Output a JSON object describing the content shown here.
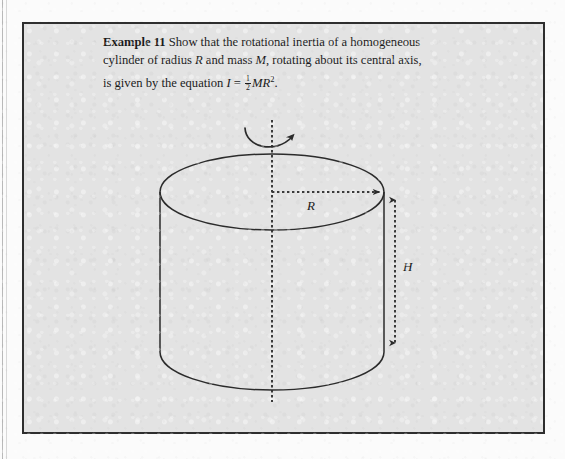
{
  "page": {
    "background_color": "#fbfbfb",
    "panel_background_color": "#e3e3e3",
    "panel_border_color": "#2e2e2e",
    "ink_color": "#1b1b1b"
  },
  "caption": {
    "example_label": "Example 11",
    "line1_text": "Show that the rotational inertia of a homogeneous",
    "line2_a": "cylinder of radius ",
    "line2_var_radius": "R",
    "line2_b": " and mass ",
    "line2_var_mass": "M",
    "line2_c": ", rotating about its central axis,",
    "line3_a": "is given by the equation ",
    "line3_var_inertia": "I",
    "line3_equals": " = ",
    "fraction_numerator": "1",
    "fraction_denominator": "2",
    "line3_var_mass": "M",
    "line3_var_radius": "R",
    "line3_exponent": "2",
    "line3_period": "."
  },
  "diagram": {
    "shape": "cylinder",
    "labels": {
      "radius": "R",
      "height": "H"
    },
    "geometry": {
      "center_x": 248,
      "top_ellipse_center_y": 168,
      "ellipse_rx": 112,
      "ellipse_ry": 38,
      "body_height": 160,
      "bottom_ellipse_center_y": 328,
      "axis_top_y": 96,
      "axis_bottom_y": 378,
      "radius_arrow_y": 168,
      "height_dim_x": 371,
      "height_dim_top_y": 172,
      "height_dim_bottom_y": 323
    },
    "annotations": {
      "rotation_arrow": "curved-rotation-arrow",
      "rotation_axis": "dashed-central-axis",
      "radius_dimension": "dashed-radius-arrow",
      "height_dimension": "dashed-height-double-arrow"
    },
    "stroke_color": "#2b2b2b",
    "dash_color": "#3a3a3a"
  }
}
